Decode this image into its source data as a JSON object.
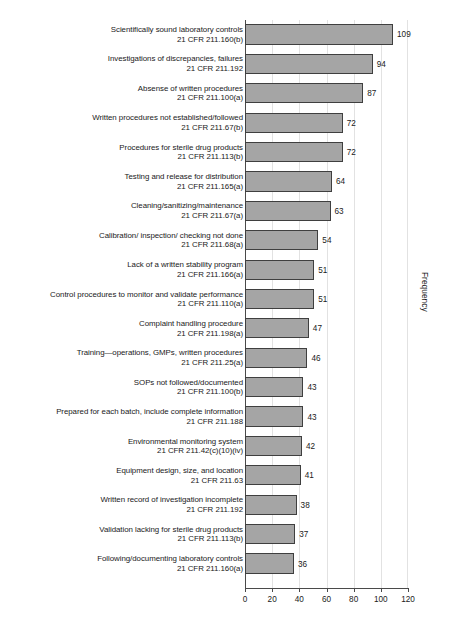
{
  "chart_data": {
    "type": "bar",
    "orientation": "horizontal",
    "title": "",
    "xlabel": "",
    "ylabel": "Frequency",
    "xlim": [
      0,
      120
    ],
    "xticks": [
      0,
      20,
      40,
      60,
      80,
      100,
      120
    ],
    "grid": true,
    "legend": null,
    "colors": {
      "bar_fill": "#a5a5a5",
      "bar_stroke": "#3f3f3f",
      "gridline": "#e2e2e2",
      "axis": "#4a4a4a",
      "text": "#1a1a1a",
      "background": "#ffffff"
    },
    "categories": [
      "Scientifically sound laboratory controls",
      "Investigations of discrepancies, failures",
      "Absense of written procedures",
      "Written procedures not established/followed",
      "Procedures for sterile drug products",
      "Testing and release for distribution",
      "Cleaning/sanitizing/maintenance",
      "Calibration/ inspection/ checking not done",
      "Lack of a written stability program",
      "Control procedures to monitor and validate performance",
      "Complaint handling procedure",
      "Training—operations, GMPs, written procedures",
      "SOPs not followed/documented",
      "Prepared for each batch, include complete information",
      "Environmental monitoring system",
      "Equipment design, size, and location",
      "Written record of investigation incomplete",
      "Validation lacking for sterile drug products",
      "Following/documenting laboratory controls"
    ],
    "regulations": [
      "21 CFR 211.160(b)",
      "21 CFR 211.192",
      "21 CFR 211.100(a)",
      "21 CFR 211.67(b)",
      "21 CFR 211.113(b)",
      "21 CFR 211.165(a)",
      "21 CFR 211.67(a)",
      "21 CFR 211.68(a)",
      "21 CFR 211.166(a)",
      "21 CFR 211.110(a)",
      "21 CFR 211.198(a)",
      "21 CFR 211.25(a)",
      "21 CFR 211.100(b)",
      "21 CFR 211.188",
      "21 CFR 211.42(c)(10)(iv)",
      "21 CFR 211.63",
      "21 CFR 211.192",
      "21 CFR 211.113(b)",
      "21 CFR 211.160(a)"
    ],
    "values": [
      109,
      94,
      87,
      72,
      72,
      64,
      63,
      54,
      51,
      51,
      47,
      46,
      43,
      43,
      42,
      41,
      38,
      37,
      36
    ]
  }
}
